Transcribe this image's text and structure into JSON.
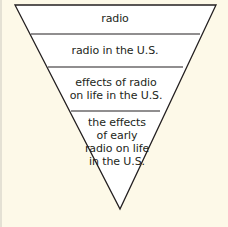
{
  "diagram": {
    "type": "inverted-triangle",
    "colors": {
      "background": "#fdf9e8",
      "fill": "#ffffff",
      "stroke": "#231f20",
      "text": "#231f20"
    },
    "levels": [
      {
        "label": "radio"
      },
      {
        "label": "radio in the U.S."
      },
      {
        "label": "effects of radio on life in the U.S."
      },
      {
        "label": "the effects of early radio on life in the U.S."
      }
    ]
  }
}
